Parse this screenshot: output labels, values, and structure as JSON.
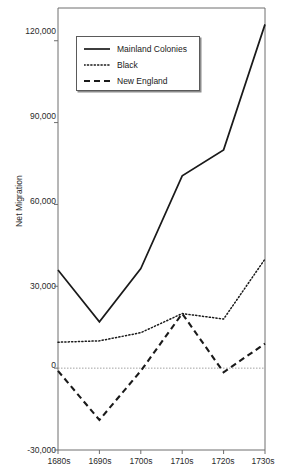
{
  "chart_data": {
    "type": "line",
    "title": "",
    "xlabel": "",
    "ylabel": "Net Migration",
    "categories": [
      "1680s",
      "1690s",
      "1700s",
      "1710s",
      "1720s",
      "1730s"
    ],
    "ylim": [
      -30000,
      132000
    ],
    "yticks": [
      -30000,
      0,
      30000,
      60000,
      90000,
      120000
    ],
    "ytick_labels": [
      "-30,000",
      "0",
      "30,000",
      "60,000",
      "90,000",
      "120,000"
    ],
    "grid": false,
    "legend_position": "top-left-inside",
    "zero_reference_line": true,
    "series": [
      {
        "name": "Mainland Colonies",
        "style": "solid",
        "values": [
          36000,
          17000,
          36500,
          70500,
          80000,
          126000
        ]
      },
      {
        "name": "Black",
        "style": "dotted",
        "values": [
          9500,
          10000,
          13000,
          20000,
          18000,
          40000
        ]
      },
      {
        "name": "New England",
        "style": "dashed",
        "values": [
          -1000,
          -19000,
          -1000,
          20000,
          -1500,
          9000
        ]
      }
    ]
  },
  "axes": {
    "y_axis_title": "Net Migration",
    "y_tick_labels": [
      "120,000",
      "90,000",
      "60,000",
      "30,000",
      "0",
      "-30,000"
    ],
    "x_tick_labels": [
      "1680s",
      "1690s",
      "1700s",
      "1710s",
      "1720s",
      "1730s"
    ]
  },
  "legend": {
    "items": [
      {
        "label": "Mainland Colonies",
        "style": "solid"
      },
      {
        "label": "Black",
        "style": "dotted"
      },
      {
        "label": "New England",
        "style": "dashed"
      }
    ]
  },
  "colors": {
    "line": "#1a1a1a",
    "axis": "#6e6e6e",
    "text": "#1a1a1a",
    "background": "#ffffff"
  }
}
